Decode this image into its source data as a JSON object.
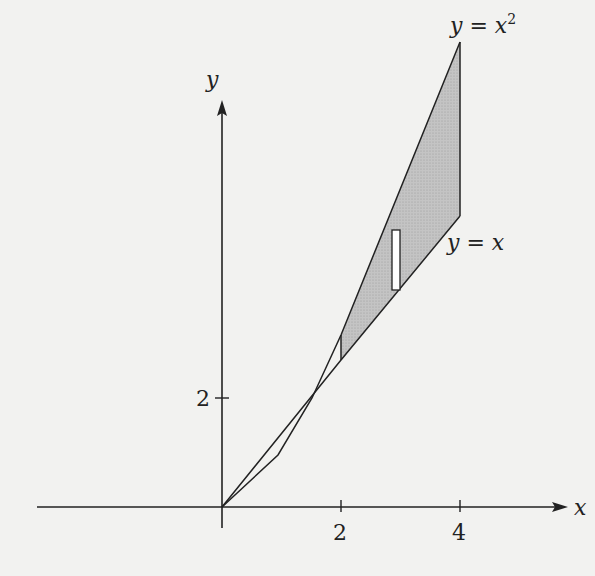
{
  "diagram": {
    "axes": {
      "x_label": "x",
      "y_label": "y",
      "x_ticks": [
        "2",
        "4"
      ],
      "y_ticks": [
        "2"
      ]
    },
    "curves": [
      {
        "name": "parabola",
        "label": "y = x²",
        "label_main": "y = x",
        "label_sup": "2"
      },
      {
        "name": "line",
        "label": "y = x"
      }
    ],
    "shaded_region": {
      "description": "region between y = x² and y = x from x ≈ 2 to x = 4",
      "fill": "#b8b8b8"
    },
    "representative_rectangle": {
      "description": "thin vertical strip in shaded region",
      "fill": "#ffffff"
    },
    "colors": {
      "background": "#f2f2f0",
      "stroke": "#222222",
      "shade": "#b8b8b8"
    }
  }
}
